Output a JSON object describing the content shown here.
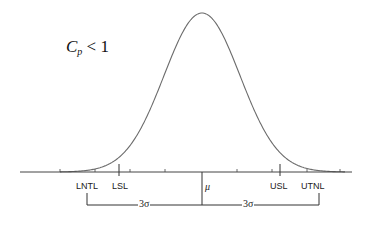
{
  "diagram": {
    "title": {
      "symbol": "C",
      "subscript": "p",
      "relation": " < 1"
    },
    "axis_labels": {
      "lntl": "LNTL",
      "lsl": "LSL",
      "mu": "μ",
      "usl": "USL",
      "utnl": "UTNL"
    },
    "brackets": {
      "left": "3σ",
      "right": "3σ"
    },
    "colors": {
      "curve": "#6b6b6b",
      "axis": "#444444",
      "text": "#222222",
      "background": "#ffffff"
    }
  }
}
